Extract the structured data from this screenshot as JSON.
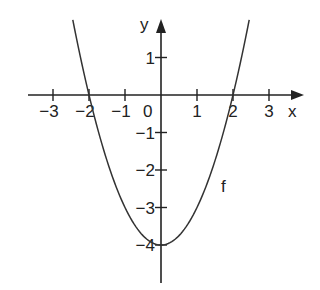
{
  "chart_data": {
    "type": "line",
    "title": "",
    "xlabel": "x",
    "ylabel": "y",
    "function_label": "f",
    "equation": "f(x) = x^2 - 4",
    "x_ticks": [
      -3,
      -2,
      -1,
      1,
      2,
      3
    ],
    "x_tick_labels": [
      "−3",
      "−2",
      "−1",
      "1",
      "2",
      "3"
    ],
    "y_ticks": [
      1,
      -1,
      -2,
      -3,
      -4
    ],
    "y_tick_labels": [
      "1",
      "−1",
      "−2",
      "−3",
      "−4"
    ],
    "origin_label": "0",
    "xlim": [
      -3.6,
      3.9
    ],
    "ylim": [
      -5.0,
      2.0
    ],
    "grid": false,
    "series": [
      {
        "name": "f",
        "x": [
          -2.45,
          -2,
          -1.5,
          -1,
          -0.5,
          0,
          0.5,
          1,
          1.5,
          2,
          2.45
        ],
        "values": [
          2.0,
          0,
          -1.75,
          -3,
          -3.75,
          -4,
          -3.75,
          -3,
          -1.75,
          0,
          2.0
        ]
      }
    ],
    "key_points": {
      "roots": [
        -2,
        2
      ],
      "vertex": [
        0,
        -4
      ]
    }
  },
  "colors": {
    "axis": "#222222",
    "curve": "#333333",
    "background": "#ffffff"
  }
}
